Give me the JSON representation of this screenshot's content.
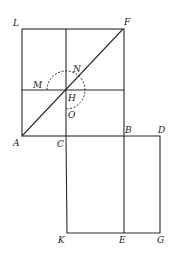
{
  "diagram": {
    "points": {
      "L": {
        "label": "L",
        "x": 22,
        "y": 29,
        "lx": 13,
        "ly": 26
      },
      "F": {
        "label": "F",
        "x": 123,
        "y": 29,
        "lx": 124,
        "ly": 25
      },
      "M": {
        "label": "M",
        "lx": 33,
        "ly": 87
      },
      "N": {
        "label": "N",
        "lx": 73,
        "ly": 70
      },
      "H": {
        "label": "H",
        "x": 66,
        "y": 90,
        "lx": 68,
        "ly": 100
      },
      "O": {
        "label": "O",
        "lx": 68,
        "ly": 117
      },
      "A": {
        "label": "A",
        "x": 22,
        "y": 136,
        "lx": 13,
        "ly": 145
      },
      "C": {
        "label": "C",
        "x": 66,
        "y": 136,
        "lx": 57,
        "ly": 146
      },
      "B": {
        "label": "B",
        "x": 124,
        "y": 136,
        "lx": 125,
        "ly": 132
      },
      "D": {
        "label": "D",
        "x": 160,
        "y": 136,
        "lx": 157,
        "ly": 132
      },
      "K": {
        "label": "K",
        "x": 67,
        "y": 233,
        "lx": 58,
        "ly": 242
      },
      "E": {
        "label": "E",
        "x": 124,
        "y": 233,
        "lx": 119,
        "ly": 242
      },
      "G": {
        "label": "G",
        "x": 160,
        "y": 233,
        "lx": 157,
        "ly": 242
      }
    },
    "circle": {
      "center": "H",
      "radius": 19,
      "style": "dashed"
    }
  }
}
